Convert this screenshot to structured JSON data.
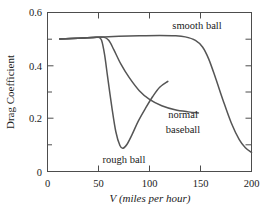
{
  "chart_data": {
    "type": "line",
    "title": "",
    "xlabel": "V (miles per hour)",
    "ylabel": "Drag Coefficient",
    "xlim": [
      0,
      200
    ],
    "ylim": [
      0,
      0.6
    ],
    "grid": false,
    "legend_position": "inline-annotations",
    "x_ticks": [
      0,
      50,
      100,
      150,
      200
    ],
    "x_tick_labels": [
      "0",
      "50",
      "100",
      "150",
      "200"
    ],
    "x_minor_ticks": [
      25,
      75,
      125,
      175
    ],
    "y_ticks": [
      0,
      0.2,
      0.4,
      0.6
    ],
    "y_tick_labels": [
      "0",
      "0.2",
      "0.4",
      "0.6"
    ],
    "y_minor_ticks": [
      0.1,
      0.3,
      0.5
    ],
    "series": [
      {
        "name": "smooth ball",
        "label": "smooth ball",
        "x": [
          12,
          30,
          50,
          70,
          90,
          110,
          125,
          135,
          145,
          152,
          158,
          165,
          172,
          180,
          188,
          194,
          200
        ],
        "y": [
          0.5,
          0.503,
          0.507,
          0.51,
          0.512,
          0.513,
          0.512,
          0.508,
          0.495,
          0.47,
          0.425,
          0.35,
          0.27,
          0.185,
          0.12,
          0.09,
          0.072
        ]
      },
      {
        "name": "normal baseball",
        "label": "normal baseball",
        "x": [
          12,
          30,
          48,
          55,
          60,
          65,
          72,
          80,
          90,
          100,
          112,
          125,
          138,
          148
        ],
        "y": [
          0.5,
          0.503,
          0.507,
          0.507,
          0.495,
          0.46,
          0.405,
          0.355,
          0.305,
          0.272,
          0.248,
          0.233,
          0.225,
          0.221
        ]
      },
      {
        "name": "rough ball",
        "label": "rough ball",
        "x": [
          12,
          30,
          45,
          50,
          53,
          56,
          59,
          63,
          67,
          71,
          74,
          78,
          83,
          89,
          96,
          103,
          110,
          118
        ],
        "y": [
          0.5,
          0.503,
          0.506,
          0.506,
          0.495,
          0.44,
          0.355,
          0.245,
          0.15,
          0.098,
          0.088,
          0.103,
          0.14,
          0.19,
          0.238,
          0.282,
          0.318,
          0.34
        ]
      }
    ],
    "annotations": [
      {
        "text": "smooth ball",
        "x_px": 197,
        "y_px": 29
      },
      {
        "text": "normal",
        "x_px": 183,
        "y_px": 118
      },
      {
        "text": "baseball",
        "x_px": 183,
        "y_px": 133
      },
      {
        "text": "rough ball",
        "x_px": 124,
        "y_px": 163
      }
    ]
  }
}
